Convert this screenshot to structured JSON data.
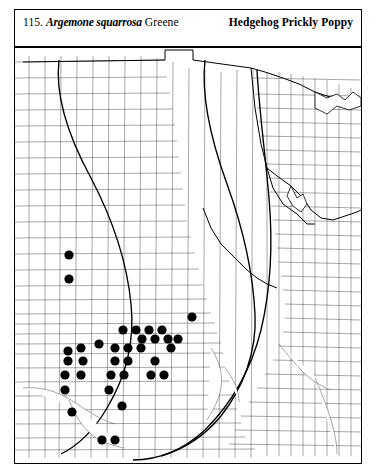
{
  "header": {
    "entry_number": "115.",
    "binomial": "Argemone squarrosa",
    "authority": "Greene",
    "common_name": "Hedgehog Prickly Poppy"
  },
  "map": {
    "kind": "county-dot-distribution-map",
    "region": "Great Plains / central United States",
    "dot_color": "#000000",
    "county_line_color": "#3a3a3a",
    "state_line_color": "#000000",
    "background_color": "#ffffff",
    "dot_radius": 4.6,
    "dot_count": 35,
    "dots": [
      {
        "x": 54,
        "y": 207
      },
      {
        "x": 54,
        "y": 231
      },
      {
        "x": 177,
        "y": 269
      },
      {
        "x": 108,
        "y": 282
      },
      {
        "x": 121,
        "y": 282
      },
      {
        "x": 134,
        "y": 282
      },
      {
        "x": 147,
        "y": 282
      },
      {
        "x": 84,
        "y": 296
      },
      {
        "x": 127,
        "y": 291
      },
      {
        "x": 140,
        "y": 291
      },
      {
        "x": 153,
        "y": 291
      },
      {
        "x": 163,
        "y": 291
      },
      {
        "x": 53,
        "y": 303
      },
      {
        "x": 66,
        "y": 300
      },
      {
        "x": 100,
        "y": 300
      },
      {
        "x": 113,
        "y": 300
      },
      {
        "x": 126,
        "y": 300
      },
      {
        "x": 156,
        "y": 300
      },
      {
        "x": 53,
        "y": 313
      },
      {
        "x": 68,
        "y": 313
      },
      {
        "x": 100,
        "y": 313
      },
      {
        "x": 113,
        "y": 313
      },
      {
        "x": 140,
        "y": 313
      },
      {
        "x": 50,
        "y": 327
      },
      {
        "x": 66,
        "y": 327
      },
      {
        "x": 96,
        "y": 327
      },
      {
        "x": 109,
        "y": 327
      },
      {
        "x": 136,
        "y": 327
      },
      {
        "x": 149,
        "y": 327
      },
      {
        "x": 50,
        "y": 342
      },
      {
        "x": 94,
        "y": 342
      },
      {
        "x": 57,
        "y": 364
      },
      {
        "x": 107,
        "y": 358
      },
      {
        "x": 87,
        "y": 392
      },
      {
        "x": 100,
        "y": 392
      }
    ]
  }
}
